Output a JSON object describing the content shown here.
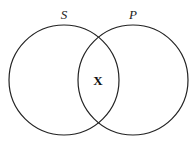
{
  "diagram": {
    "type": "venn",
    "sets": [
      {
        "label": "S",
        "cx": 64,
        "cy": 80,
        "r": 55
      },
      {
        "label": "P",
        "cx": 133,
        "cy": 80,
        "r": 55
      }
    ],
    "intersection_mark": "X",
    "stroke_color": "#222222"
  }
}
